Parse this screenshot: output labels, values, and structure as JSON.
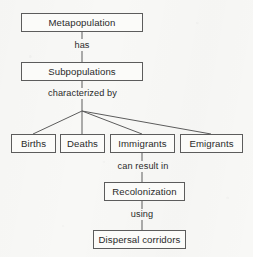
{
  "diagram": {
    "type": "flow-chart",
    "background_color": "#f8f8f6",
    "line_color": "#5c5c5c",
    "text_color": "#2a2a2a",
    "nodes": [
      {
        "id": "metapopulation",
        "label": "Metapopulation",
        "x": 21,
        "y": 13,
        "w": 122,
        "h": 19
      },
      {
        "id": "subpopulations",
        "label": "Subpopulations",
        "x": 21,
        "y": 62,
        "w": 122,
        "h": 19
      },
      {
        "id": "births",
        "label": "Births",
        "x": 11,
        "y": 134,
        "w": 45,
        "h": 19
      },
      {
        "id": "deaths",
        "label": "Deaths",
        "x": 60,
        "y": 134,
        "w": 45,
        "h": 19
      },
      {
        "id": "immigrants",
        "label": "Immigrants",
        "x": 110,
        "y": 134,
        "w": 65,
        "h": 19
      },
      {
        "id": "emigrants",
        "label": "Emigrants",
        "x": 180,
        "y": 134,
        "w": 63,
        "h": 19
      },
      {
        "id": "recolonization",
        "label": "Recolonization",
        "x": 104,
        "y": 182,
        "w": 81,
        "h": 19
      },
      {
        "id": "dispersal-corridors",
        "label": "Dispersal corridors",
        "x": 93,
        "y": 230,
        "w": 93,
        "h": 19
      }
    ],
    "edge_labels": [
      {
        "id": "has",
        "text": "has",
        "x": 62,
        "y": 41,
        "w": 40
      },
      {
        "id": "characterized-by",
        "text": "characterized by",
        "x": 40,
        "y": 89,
        "w": 85
      },
      {
        "id": "can-result-in",
        "text": "can result in",
        "x": 108,
        "y": 162,
        "w": 70
      },
      {
        "id": "using",
        "text": "using",
        "x": 122,
        "y": 210,
        "w": 40
      }
    ],
    "connectors": [
      {
        "id": "metapopulation-to-has",
        "from": "metapopulation",
        "to": "has-label",
        "path": "M 82 32 L 82 39"
      },
      {
        "id": "has-to-subpopulations",
        "from": "has-label",
        "to": "subpopulations",
        "path": "M 82 51 L 82 62"
      },
      {
        "id": "subpopulations-to-characterized",
        "from": "subpopulations",
        "to": "characterized-by",
        "path": "M 82 81 L 82 88"
      },
      {
        "id": "characterized-to-junction",
        "from": "characterized-by",
        "to": "fan-junction",
        "path": "M 82 99 L 82 111"
      },
      {
        "id": "junction-to-births",
        "from": "fan-junction",
        "to": "births",
        "path": "M 82 111 L 33 134"
      },
      {
        "id": "junction-to-deaths",
        "from": "fan-junction",
        "to": "deaths",
        "path": "M 82 111 L 82 134"
      },
      {
        "id": "junction-to-immigrants",
        "from": "fan-junction",
        "to": "immigrants",
        "path": "M 82 111 L 142 134"
      },
      {
        "id": "junction-to-emigrants",
        "from": "fan-junction",
        "to": "emigrants",
        "path": "M 82 111 L 211 134"
      },
      {
        "id": "immigrants-to-can-result-in",
        "from": "immigrants",
        "to": "can-result-in",
        "path": "M 142 153 L 142 161"
      },
      {
        "id": "can-result-in-to-recolonization",
        "from": "can-result-in",
        "to": "recolonization",
        "path": "M 142 172 L 142 182"
      },
      {
        "id": "recolonization-to-using",
        "from": "recolonization",
        "to": "using",
        "path": "M 142 201 L 142 209"
      },
      {
        "id": "using-to-dispersal",
        "from": "using",
        "to": "dispersal-corridors",
        "path": "M 142 220 L 142 230"
      }
    ]
  }
}
